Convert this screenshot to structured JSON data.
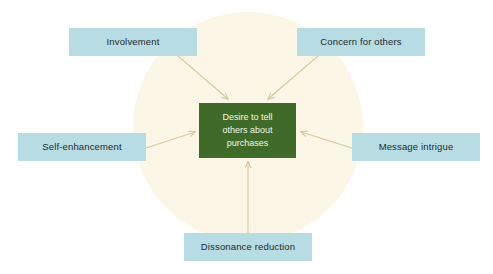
{
  "diagram": {
    "title": "Desire to tell others about purchases",
    "type": "radial-influence-diagram",
    "background_shape": "circle",
    "colors": {
      "canvas": "#ffffff",
      "circle": "#fbf6e6",
      "factor_box": "#b8dce4",
      "factor_text": "#23282b",
      "center_box": "#3f6b28",
      "center_text": "#f3f4ec",
      "arrow": "#d6c99a"
    },
    "center": {
      "label": "Desire to tell others about purchases",
      "lines": [
        "Desire to tell",
        "others about",
        "purchases"
      ]
    },
    "factors": [
      {
        "id": "involvement",
        "label": "Involvement",
        "position": "top-left",
        "arrow_direction": "to-center"
      },
      {
        "id": "concern-for-others",
        "label": "Concern for others",
        "position": "top-right",
        "arrow_direction": "to-center"
      },
      {
        "id": "self-enhancement",
        "label": "Self-enhancement",
        "position": "left",
        "arrow_direction": "to-center"
      },
      {
        "id": "message-intrigue",
        "label": "Message intrigue",
        "position": "right",
        "arrow_direction": "to-center"
      },
      {
        "id": "dissonance-reduction",
        "label": "Dissonance reduction",
        "position": "bottom",
        "arrow_direction": "to-center"
      }
    ]
  }
}
